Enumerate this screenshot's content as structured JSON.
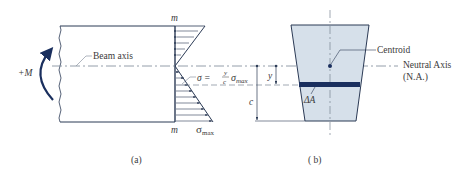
{
  "figure": {
    "colors": {
      "line": "#2b3a55",
      "dark_blue": "#1a2f5e",
      "section_fill": "#d6e0ea",
      "dash": "#7a8594",
      "text": "#3a3a3a"
    },
    "panel_a": {
      "caption": "(a)",
      "moment_label": "+M",
      "beam_axis_label": "Beam axis",
      "section_top_label": "m",
      "section_bottom_label": "m",
      "stress_formula": {
        "lhs": "σ =",
        "numerator": "y",
        "denominator": "c",
        "rhs": "σ",
        "rhs_sub": "max"
      },
      "sigma_max_label": "σ",
      "sigma_max_sub": "max"
    },
    "panel_b": {
      "caption": "( b)",
      "centroid_label": "Centroid",
      "neutral_axis_label": "Neutral Axis",
      "neutral_axis_abbrev": "(N.A.)",
      "area_element_label": "ΔA",
      "dim_y_label": "y",
      "dim_c_label": "c"
    }
  }
}
